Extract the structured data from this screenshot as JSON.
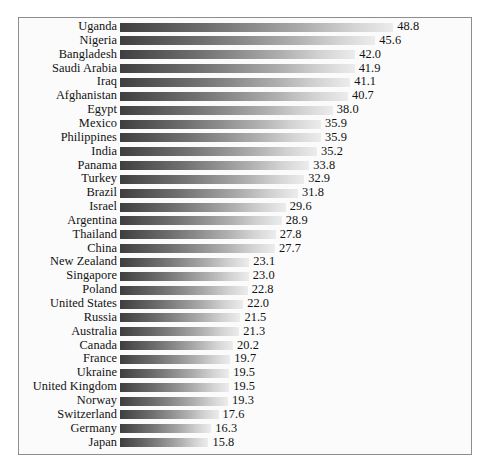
{
  "chart_data": {
    "type": "bar",
    "orientation": "horizontal",
    "title": "",
    "subtitle": "",
    "xlabel": "",
    "ylabel": "",
    "grid": false,
    "legend": null,
    "axis_visible": false,
    "value_labels_shown": true,
    "value_label_format": "one decimal",
    "xlim": [
      0,
      48.8
    ],
    "sort_order": "descending",
    "bar_style": "horizontal gradient, dark gray at left fading to light gray at right",
    "frame": "thin gray rectangle border around plot area",
    "categories": [
      "Uganda",
      "Nigeria",
      "Bangladesh",
      "Saudi Arabia",
      "Iraq",
      "Afghanistan",
      "Egypt",
      "Mexico",
      "Philippines",
      "India",
      "Panama",
      "Turkey",
      "Brazil",
      "Israel",
      "Argentina",
      "Thailand",
      "China",
      "New Zealand",
      "Singapore",
      "Poland",
      "United States",
      "Russia",
      "Australia",
      "Canada",
      "France",
      "Ukraine",
      "United Kingdom",
      "Norway",
      "Switzerland",
      "Germany",
      "Japan"
    ],
    "values": [
      48.8,
      45.6,
      42.0,
      41.9,
      41.1,
      40.7,
      38.0,
      35.9,
      35.9,
      35.2,
      33.8,
      32.9,
      31.8,
      29.6,
      28.9,
      27.8,
      27.7,
      23.1,
      23.0,
      22.8,
      22.0,
      21.5,
      21.3,
      20.2,
      19.7,
      19.5,
      19.5,
      19.3,
      17.6,
      16.3,
      15.8
    ],
    "value_labels": [
      "48.8",
      "45.6",
      "42.0",
      "41.9",
      "41.1",
      "40.7",
      "38.0",
      "35.9",
      "35.9",
      "35.2",
      "33.8",
      "32.9",
      "31.8",
      "29.6",
      "28.9",
      "27.8",
      "27.7",
      "23.1",
      "23.0",
      "22.8",
      "22.0",
      "21.5",
      "21.3",
      "20.2",
      "19.7",
      "19.5",
      "19.5",
      "19.3",
      "17.6",
      "16.3",
      "15.8"
    ],
    "colors": {
      "bar_gradient_start": "#3f3f3f",
      "bar_gradient_end": "#ececec",
      "text": "#121212",
      "frame_border": "#8d8d8d",
      "plot_background": "#fbfbfb",
      "page_background": "#ffffff"
    }
  },
  "layout": {
    "bar_origin_x": 120,
    "px_per_unit": 5.6,
    "first_row_top": 20.0,
    "row_pitch": 13.85
  }
}
